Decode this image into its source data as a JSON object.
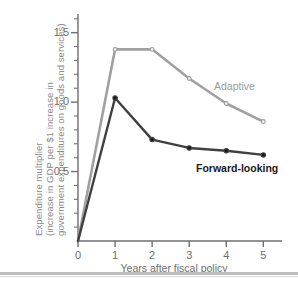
{
  "chart_data": {
    "type": "line",
    "title": "",
    "xlabel": "Years after fiscal policy",
    "ylabel_lines": [
      "Expenditure multiplier",
      "(increase in GDP per $1 increase in",
      "government expenditures on goods and services)"
    ],
    "x": [
      0,
      1,
      2,
      3,
      4,
      5
    ],
    "xtick_labels": [
      "0",
      "1",
      "2",
      "3",
      "4",
      "5"
    ],
    "ytick_labels": [
      "0.5",
      "1.0",
      "1.5"
    ],
    "ytick_values": [
      0.5,
      1.0,
      1.5
    ],
    "xlim": [
      0,
      5.45
    ],
    "ylim": [
      0,
      1.62
    ],
    "grid": false,
    "legend_position": "inline-annotations",
    "minor_tick_step": 0.1,
    "series": [
      {
        "name": "Adaptive",
        "color": "#a0a0a0",
        "values": [
          0,
          1.38,
          1.38,
          1.17,
          0.99,
          0.86
        ]
      },
      {
        "name": "Forward-looking",
        "color": "#404040",
        "values": [
          0,
          1.03,
          0.73,
          0.67,
          0.65,
          0.62
        ]
      }
    ]
  },
  "annotations": {
    "adaptive_label": "Adaptive",
    "forward_label": "Forward-looking"
  },
  "axes": {
    "x_title": "Years after fiscal policy"
  },
  "colors": {
    "adaptive": "#a0a0a0",
    "forward": "#404040",
    "axis": "#6f6f6f",
    "label_text": "#8a8a8a",
    "rule": "#bdbdbd"
  }
}
